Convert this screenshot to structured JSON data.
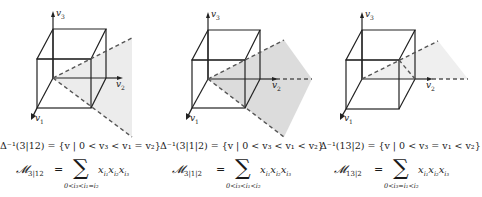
{
  "figure": {
    "panels": [
      {
        "id": "3|12",
        "axes": {
          "x": "v1",
          "y": "v2",
          "z": "v3"
        },
        "region_formula": "Δ⁻¹(3|12) = {v | 0 < v₃ < v₁ = v₂}",
        "monomial_name": "𝓜",
        "monomial_subscript": "3|12",
        "equals": "=",
        "sum_symbol": "∑",
        "sum_limits": "0<i₃<i₁=i₂",
        "summand": "x_{i₁} x_{i₂} x_{i₃}",
        "summand_parts": [
          "x",
          "i₁",
          "x",
          "i₂",
          "x",
          "i₃"
        ],
        "shaded_region": "half-plane wedge between rays through (1,1,1) and (1,1,0) directions",
        "shade_color": "#ececec"
      },
      {
        "id": "3|1|2",
        "axes": {
          "x": "v1",
          "y": "v2",
          "z": "v3"
        },
        "region_formula": "Δ⁻¹(3|1|2) = {v | 0 < v₃ < v₁ < v₂}",
        "monomial_name": "𝓜",
        "monomial_subscript": "3|1|2",
        "equals": "=",
        "sum_symbol": "∑",
        "sum_limits": "0<i₃<i₁<i₂",
        "summand": "x_{i₁} x_{i₂} x_{i₃}",
        "summand_parts": [
          "x",
          "i₁",
          "x",
          "i₂",
          "x",
          "i₃"
        ],
        "shaded_region": "open cone bounded by three dashed rays",
        "shade_color": "#dcdcdc"
      },
      {
        "id": "13|2",
        "axes": {
          "x": "v1",
          "y": "v2",
          "z": "v3"
        },
        "region_formula": "Δ⁻¹(13|2) = {v | 0 < v₃ = v₁ < v₂}",
        "monomial_name": "𝓜",
        "monomial_subscript": "13|2",
        "equals": "=",
        "sum_symbol": "∑",
        "sum_limits": "0<i₃=i₁<i₂",
        "summand": "x_{i₁} x_{i₂} x_{i₃}",
        "summand_parts": [
          "x",
          "i₁",
          "x",
          "i₂",
          "x",
          "i₃"
        ],
        "shaded_region": "planar wedge between ray through (1,1,1) and v2 axis",
        "shade_color": "#efefef"
      }
    ],
    "axis_labels": {
      "v1": "v",
      "v1_sub": "1",
      "v2": "v",
      "v2_sub": "2",
      "v3": "v",
      "v3_sub": "3"
    },
    "colors": {
      "line": "#222222",
      "dash": "#555555",
      "background": "#ffffff"
    }
  }
}
